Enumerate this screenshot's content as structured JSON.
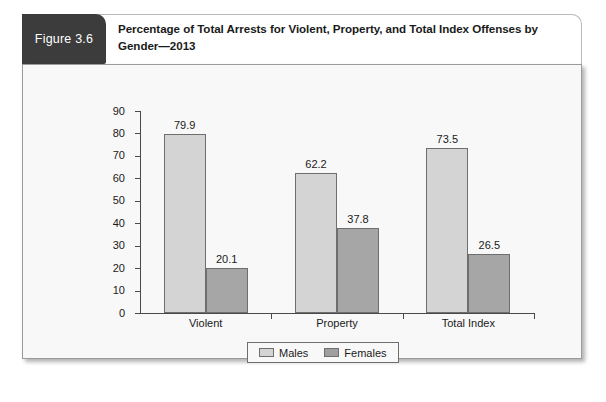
{
  "figure": {
    "badge_label": "Figure 3.6",
    "title": "Percentage of Total Arrests for Violent, Property, and Total Index Offenses by Gender—2013"
  },
  "colors": {
    "badge_background": "#3c3c3c",
    "males_bar": "#d4d4d4",
    "females_bar": "#a6a6a6",
    "bar_outline": "#6e6e6e",
    "panel_background": "#f8f8f8",
    "axis": "#4a4a4a"
  },
  "chart_data": {
    "type": "bar",
    "title": "Percentage of Total Arrests for Violent, Property, and Total Index Offenses by Gender—2013",
    "categories": [
      "Violent",
      "Property",
      "Total Index"
    ],
    "series": [
      {
        "name": "Males",
        "values": [
          79.9,
          62.2,
          73.5
        ]
      },
      {
        "name": "Females",
        "values": [
          20.1,
          37.8,
          26.5
        ]
      }
    ],
    "value_labels": [
      [
        "79.9",
        "20.1"
      ],
      [
        "62.2",
        "37.8"
      ],
      [
        "73.5",
        "26.5"
      ]
    ],
    "xlabel": "",
    "ylabel": "",
    "ylim": [
      0,
      90
    ],
    "yticks": [
      0,
      10,
      20,
      30,
      40,
      50,
      60,
      70,
      80,
      90
    ],
    "ytick_labels": [
      "0",
      "10",
      "20",
      "30",
      "40",
      "50",
      "60",
      "70",
      "80",
      "90"
    ],
    "grid": false,
    "legend": {
      "position": "bottom-center",
      "entries": [
        "Males",
        "Females"
      ]
    }
  }
}
